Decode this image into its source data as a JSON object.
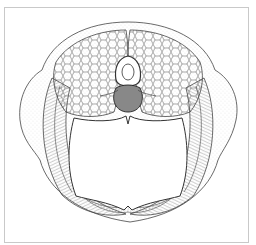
{
  "figure": {
    "kind": "anatomical cross-section illustration",
    "colors": {
      "line": "#3a3a3a",
      "hatch": "#6b6b6b",
      "frame": "#c9c9c9",
      "background": "#ffffff",
      "stipple": "#9a9a9a"
    }
  },
  "caption": {
    "text": ""
  }
}
